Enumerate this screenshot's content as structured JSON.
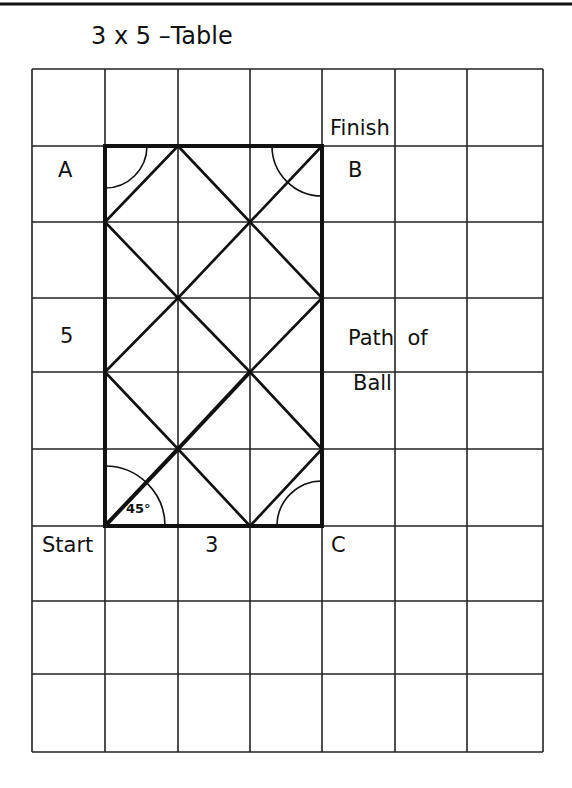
{
  "title": "3 x 5 –Table",
  "labels": {
    "finish": "Finish",
    "a": "A",
    "b": "B",
    "c": "C",
    "start": "Start",
    "width_value": "3",
    "height_value": "5",
    "path_line1": "Path  of",
    "path_line2": "Ball",
    "angle": "45°"
  },
  "colors": {
    "ink": "#111111",
    "background": "#ffffff"
  },
  "grid": {
    "columns": 7,
    "rows": 9,
    "x_lines": [
      32,
      105,
      178,
      250,
      322,
      395,
      467,
      543
    ],
    "y_lines": [
      69,
      146,
      222,
      298,
      372,
      449,
      526,
      601,
      674,
      752
    ]
  },
  "table": {
    "width_units": 3,
    "height_units": 5,
    "corners": {
      "start": [
        105,
        526
      ],
      "a": [
        105,
        146
      ],
      "b": [
        322,
        146
      ],
      "c": [
        322,
        526
      ]
    }
  },
  "path": {
    "bounce_angle_deg": 45,
    "segments_lattice": [
      [
        [
          0,
          0
        ],
        [
          1,
          1
        ]
      ],
      [
        [
          1,
          1
        ],
        [
          2,
          2
        ]
      ],
      [
        [
          2,
          2
        ],
        [
          3,
          3
        ]
      ],
      [
        [
          1,
          1
        ],
        [
          2,
          0
        ]
      ],
      [
        [
          2,
          0
        ],
        [
          3,
          1
        ]
      ],
      [
        [
          3,
          1
        ],
        [
          2,
          2
        ]
      ],
      [
        [
          0,
          2
        ],
        [
          1,
          1
        ]
      ],
      [
        [
          0,
          2
        ],
        [
          1,
          3
        ]
      ],
      [
        [
          1,
          3
        ],
        [
          2,
          2
        ]
      ],
      [
        [
          1,
          3
        ],
        [
          2,
          4
        ]
      ],
      [
        [
          2,
          4
        ],
        [
          3,
          5
        ]
      ],
      [
        [
          0,
          4
        ],
        [
          1,
          3
        ]
      ],
      [
        [
          0,
          4
        ],
        [
          1,
          5
        ]
      ],
      [
        [
          1,
          5
        ],
        [
          2,
          4
        ]
      ],
      [
        [
          2,
          4
        ],
        [
          3,
          3
        ]
      ]
    ],
    "highlighted_segments": [
      [
        [
          0,
          0
        ],
        [
          1,
          1
        ]
      ],
      [
        [
          1,
          1
        ],
        [
          2,
          2
        ]
      ]
    ]
  },
  "arcs": [
    {
      "corner": "start",
      "radius": 60,
      "from_deg": 0,
      "to_deg": 90
    },
    {
      "corner": "a",
      "radius": 42,
      "quadrant": "down-right"
    },
    {
      "corner": "b",
      "radius": 50,
      "quadrant": "down-left"
    },
    {
      "corner": "c",
      "radius": 45,
      "quadrant": "up-left"
    }
  ]
}
